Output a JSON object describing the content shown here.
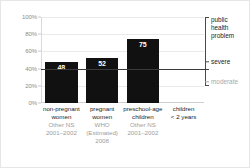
{
  "chart_data": {
    "type": "bar",
    "title": "",
    "subtitle": "",
    "xlabel": "",
    "ylabel": "",
    "ylim": [
      0,
      100
    ],
    "grid": true,
    "y_ticks": [
      {
        "value": 0,
        "label": "0%"
      },
      {
        "value": 20,
        "label": "20%"
      },
      {
        "value": 40,
        "label": "40%"
      },
      {
        "value": 60,
        "label": "60%"
      },
      {
        "value": 80,
        "label": "80%"
      },
      {
        "value": 100,
        "label": "100%"
      }
    ],
    "categories": [
      "non-pregnant women",
      "pregnant women",
      "preschool-age children",
      "children < 2 years"
    ],
    "values": [
      48,
      52,
      75,
      null
    ],
    "bars": [
      {
        "name_line1": "non-pregnant",
        "name_line2": "women",
        "source_line1": "Other NS",
        "source_line2": "2001–2002",
        "source_line3": "",
        "value": 48,
        "value_label": "48"
      },
      {
        "name_line1": "pregnant",
        "name_line2": "women",
        "source_line1": "WHO",
        "source_line2": "(Estimated)",
        "source_line3": "2008",
        "value": 52,
        "value_label": "52"
      },
      {
        "name_line1": "preschool-age",
        "name_line2": "children",
        "source_line1": "Other NS",
        "source_line2": "2001–2002",
        "source_line3": "",
        "value": 75,
        "value_label": "75"
      },
      {
        "name_line1": "children",
        "name_line2": "< 2 years",
        "source_line1": "",
        "source_line2": "",
        "source_line3": "",
        "value": null,
        "value_label": ""
      }
    ],
    "threshold_line": {
      "value": 40,
      "label": ""
    },
    "annotations": {
      "bracket_label_line1": "public",
      "bracket_label_line2": "health",
      "bracket_label_line3": "problem",
      "severe_label": "severe",
      "moderate_label": "moderate",
      "bracket_top_value": 100,
      "bracket_bottom_value": 20,
      "severe_tick_value": 48,
      "moderate_tick_value": 25
    },
    "colors": {
      "bar": "#111111",
      "value_text": "#ffffff",
      "gridline": "#e9e9e9",
      "axis": "#cfcfcf",
      "tick_label": "#8a8a8a",
      "category_label": "#1b1b1b",
      "source_label": "#9d9d9d",
      "threshold": "#3a3a3a",
      "bracket": "#4a4a4a",
      "muted": "#a8a8a8",
      "background": "#ffffff"
    }
  }
}
